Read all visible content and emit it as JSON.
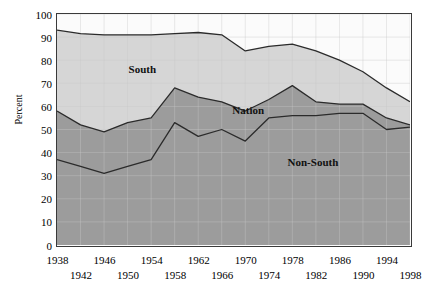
{
  "chart_data": {
    "type": "area",
    "title": "",
    "xlabel": "",
    "ylabel": "Percent",
    "ylim": [
      0,
      100
    ],
    "xlim": [
      1938,
      1998
    ],
    "grid": true,
    "legend_position": "inline-annotations",
    "x": [
      1938,
      1942,
      1946,
      1950,
      1954,
      1958,
      1962,
      1966,
      1970,
      1974,
      1978,
      1982,
      1986,
      1990,
      1994,
      1998
    ],
    "series": [
      {
        "name": "South",
        "color": "#d6d6d6",
        "values": [
          93,
          91.5,
          91,
          91,
          91,
          91.5,
          92,
          91,
          84,
          86,
          87,
          84,
          80,
          75,
          68,
          62
        ]
      },
      {
        "name": "Nation",
        "color": "#9c9c9c",
        "values": [
          58,
          52,
          49,
          53,
          55,
          68,
          64,
          62,
          58,
          63,
          69,
          62,
          61,
          61,
          55,
          52
        ]
      },
      {
        "name": "Non-South",
        "color": "#9c9c9c",
        "values": [
          37,
          34,
          31,
          34,
          37,
          53,
          47,
          50,
          45,
          55,
          56,
          56,
          57,
          57,
          50,
          51
        ]
      }
    ],
    "yticks": [
      {
        "value": 100,
        "label": "100"
      },
      {
        "value": 90,
        "label": "90"
      },
      {
        "value": 80,
        "label": "80"
      },
      {
        "value": 70,
        "label": "70"
      },
      {
        "value": 60,
        "label": "60"
      },
      {
        "value": 50,
        "label": "50"
      },
      {
        "value": 40,
        "label": "40"
      },
      {
        "value": 30,
        "label": "30"
      },
      {
        "value": 20,
        "label": "20"
      },
      {
        "value": 10,
        "label": "10"
      },
      {
        "value": 0,
        "label": "0"
      }
    ],
    "xticks": [
      {
        "value": 1938,
        "label": "1938",
        "row": 0
      },
      {
        "value": 1942,
        "label": "1942",
        "row": 1
      },
      {
        "value": 1946,
        "label": "1946",
        "row": 0
      },
      {
        "value": 1950,
        "label": "1950",
        "row": 1
      },
      {
        "value": 1954,
        "label": "1954",
        "row": 0
      },
      {
        "value": 1958,
        "label": "1958",
        "row": 1
      },
      {
        "value": 1962,
        "label": "1962",
        "row": 0
      },
      {
        "value": 1966,
        "label": "1966",
        "row": 1
      },
      {
        "value": 1970,
        "label": "1970",
        "row": 0
      },
      {
        "value": 1974,
        "label": "1974",
        "row": 1
      },
      {
        "value": 1978,
        "label": "1978",
        "row": 0
      },
      {
        "value": 1982,
        "label": "1982",
        "row": 1
      },
      {
        "value": 1986,
        "label": "1986",
        "row": 0
      },
      {
        "value": 1990,
        "label": "1990",
        "row": 1
      },
      {
        "value": 1994,
        "label": "1994",
        "row": 0
      },
      {
        "value": 1998,
        "label": "1998",
        "row": 1
      }
    ],
    "annotations": [
      {
        "text": "South",
        "x": 1952.5,
        "y": 76
      },
      {
        "text": "Nation",
        "x": 1970.5,
        "y": 58.5
      },
      {
        "text": "Non-South",
        "x": 1981.5,
        "y": 36
      }
    ],
    "colors": {
      "band_top": "#fbfbfb",
      "band_south": "#d6d6d6",
      "band_nonsouth": "#9c9c9c",
      "line": "#2b2b2b",
      "grid": "#c9c9c9",
      "frame": "#3a3a3a",
      "text": "#000000"
    }
  }
}
